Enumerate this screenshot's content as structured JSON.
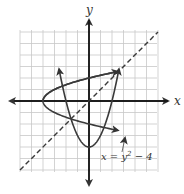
{
  "chart_data": {
    "type": "line",
    "title": "",
    "xlabel": "x",
    "ylabel": "y",
    "xlim": [
      -6,
      6
    ],
    "ylim": [
      -6,
      6
    ],
    "grid": true,
    "series": [
      {
        "name": "x = y^2 - 4",
        "style": "solid",
        "equation": "x = y^2 - 4",
        "vertex": [
          -4,
          0
        ]
      },
      {
        "name": "y = x^2 - 4",
        "style": "solid",
        "equation": "y = x^2 - 4",
        "vertex": [
          0,
          -4
        ]
      },
      {
        "name": "y = x",
        "style": "dashed",
        "equation": "y = x"
      }
    ],
    "intersections": [
      [
        2.56,
        2.56
      ],
      [
        -1.56,
        -1.56
      ]
    ],
    "annotations": [
      {
        "text": "x = y² − 4",
        "target": "x = y^2 - 4",
        "arrow": true
      }
    ]
  },
  "labels": {
    "x_axis": "x",
    "y_axis": "y",
    "equation_part1": "x = y",
    "equation_sup": "2",
    "equation_part2": " − 4"
  },
  "colors": {
    "curve": "#3a3a3a",
    "grid": "#c8c8c8",
    "axis": "#111111"
  }
}
